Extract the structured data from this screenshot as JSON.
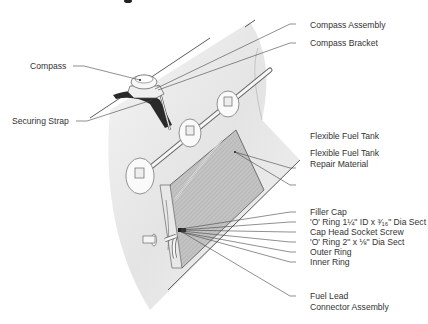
{
  "diagram": {
    "title_fragment": "g",
    "labels": {
      "compass": "Compass",
      "securing_strap": "Securing Strap",
      "compass_assembly": "Compass Assembly",
      "compass_bracket": "Compass Bracket",
      "flexible_fuel_tank": "Flexible Fuel Tank",
      "repair_material_line1": "Flexible Fuel Tank",
      "repair_material_line2": "Repair Material",
      "filler_cap": "Filler Cap",
      "o_ring_small": "'O' Ring 1¼\" ID x ³⁄₁₆\" Dia Sect",
      "cap_head_screw": "Cap Head Socket Screw",
      "o_ring_large": "'O' Ring 2\" x ⅛\" Dia Sect",
      "outer_ring": "Outer Ring",
      "inner_ring": "Inner Ring",
      "fuel_lead_line1": "Fuel Lead",
      "fuel_lead_line2": "Connector Assembly"
    },
    "colors": {
      "hull": "#e6e6e6",
      "tank": "#bdbdbd",
      "strap": "#2a2a2a",
      "line": "#444444",
      "text": "#333333"
    }
  }
}
